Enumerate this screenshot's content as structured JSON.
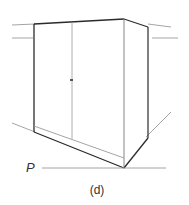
{
  "figure": {
    "point_label": "P",
    "caption": "(d)",
    "colors": {
      "outline": "#2b2b2b",
      "thin_line": "#9a9a9a",
      "text": "#333333"
    }
  }
}
